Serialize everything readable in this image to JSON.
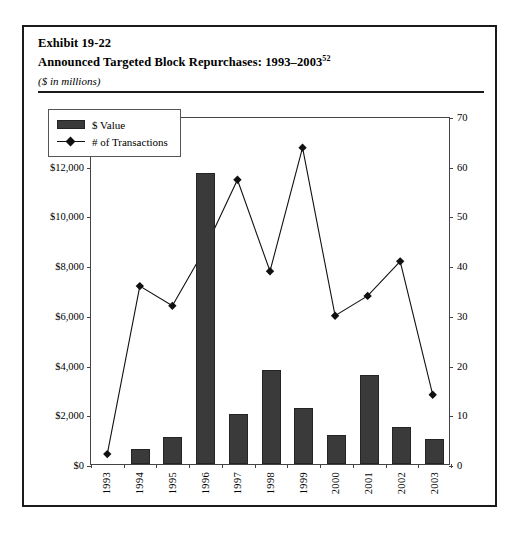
{
  "exhibit": {
    "number_line": "Exhibit 19-22",
    "title_line": "Announced Targeted Block Repurchases: 1993–2003",
    "title_footnote": "52",
    "units_note": "($ in millions)"
  },
  "legend": {
    "bar_label": "$ Value",
    "line_label": "# of Transactions"
  },
  "axes": {
    "left_ticks": [
      "$0",
      "$2,000",
      "$4,000",
      "$6,000",
      "$8,000",
      "$10,000",
      "$12,000",
      "$14,000"
    ],
    "right_ticks": [
      "0",
      "10",
      "20",
      "30",
      "40",
      "50",
      "60",
      "70"
    ]
  },
  "chart_data": {
    "type": "bar",
    "title": "Announced Targeted Block Repurchases: 1993–2003",
    "subtitle": "($ in millions)",
    "xlabel": "",
    "ylabel": "$ Value",
    "y2label": "# of Transactions",
    "grid": false,
    "legend_position": "top-left-inside",
    "categories": [
      "1993",
      "1994",
      "1995",
      "1996",
      "1997",
      "1998",
      "1999",
      "2000",
      "2001",
      "2002",
      "2003"
    ],
    "ylim": [
      0,
      14000
    ],
    "y2lim": [
      0,
      70
    ],
    "series": [
      {
        "name": "$ Value",
        "type": "bar",
        "axis": "left",
        "color": "#3a3a3a",
        "values": [
          0,
          600,
          1100,
          11700,
          2000,
          3800,
          2250,
          1150,
          3600,
          1500,
          1000
        ]
      },
      {
        "name": "# of Transactions",
        "type": "line",
        "axis": "right",
        "color": "#111111",
        "marker": "diamond",
        "values": [
          2,
          36,
          32,
          43.5,
          57.5,
          39,
          64,
          30,
          34,
          41,
          14
        ]
      }
    ]
  }
}
